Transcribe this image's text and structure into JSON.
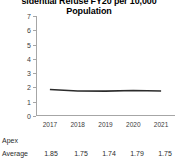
{
  "chart_data": {
    "type": "line",
    "title": "sidential Refuse FY20 per 10,000",
    "title_line2": "Population",
    "title_full": "Residential Refuse FY20 per 10,000 Population",
    "xlabel": "",
    "ylabel": "",
    "categories": [
      "2017",
      "2018",
      "2019",
      "2020",
      "2021"
    ],
    "ylim": [
      0,
      7
    ],
    "yticks": [
      "0",
      "1",
      "2",
      "3",
      "4",
      "5",
      "6",
      "7"
    ],
    "grid": false,
    "legend": "none",
    "series": [
      {
        "name": "Apex",
        "values": [
          null,
          null,
          null,
          null,
          null
        ]
      },
      {
        "name": "Average",
        "values": [
          1.85,
          1.75,
          1.74,
          1.79,
          1.75
        ],
        "color": "#2b2b2b"
      }
    ]
  },
  "table": {
    "rows": [
      {
        "label": "Apex",
        "cells": [
          "",
          "",
          "",
          "",
          ""
        ]
      },
      {
        "label": "Average",
        "cells": [
          "1.85",
          "1.75",
          "1.74",
          "1.79",
          "1.75"
        ]
      }
    ]
  },
  "colors": {
    "line": "#2b2b2b",
    "axis": "#a6a6a6",
    "text": "#2b2b2b",
    "title": "#000000"
  }
}
